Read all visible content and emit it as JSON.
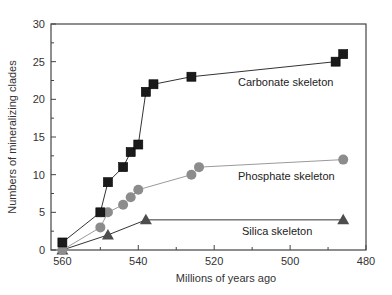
{
  "chart_data": {
    "type": "line",
    "title": "",
    "xlabel": "Millions of years ago",
    "ylabel": "Numbers of mineralizing clades",
    "xlim": [
      563,
      480
    ],
    "ylim": [
      0,
      30
    ],
    "x_reversed": true,
    "grid": false,
    "legend": "inline labels",
    "x_ticks": [
      560,
      540,
      520,
      500,
      480
    ],
    "y_ticks": [
      0,
      5,
      10,
      15,
      20,
      25,
      30
    ],
    "series": [
      {
        "name": "Carbonate skeleton",
        "marker": "square",
        "color": "#1a1a1a",
        "x": [
          560,
          550,
          548,
          544,
          542,
          540,
          538,
          536,
          526,
          488,
          486
        ],
        "values": [
          1,
          5,
          9,
          11,
          13,
          14,
          21,
          22,
          23,
          25,
          26
        ]
      },
      {
        "name": "Phosphate skeleton",
        "marker": "circle",
        "color": "#8c8c8c",
        "x": [
          560,
          550,
          548,
          544,
          542,
          540,
          526,
          524,
          486
        ],
        "values": [
          0,
          3,
          5,
          6,
          7,
          8,
          10,
          11,
          12
        ]
      },
      {
        "name": "Silica skeleton",
        "marker": "triangle",
        "color": "#4d4d4d",
        "x": [
          560,
          548,
          538,
          486
        ],
        "values": [
          0,
          2,
          4,
          4
        ]
      }
    ]
  },
  "labels": {
    "carbonate": "Carbonate skeleton",
    "phosphate": "Phosphate skeleton",
    "silica": "Silica skeleton",
    "xlabel": "Millions of years ago",
    "ylabel": "Numbers of mineralizing clades"
  }
}
